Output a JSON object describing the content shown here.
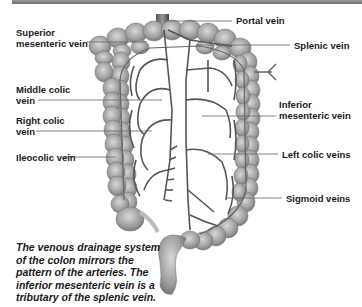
{
  "diagram": {
    "labels": {
      "portal_vein": "Portal vein",
      "superior_mesenteric_vein_l1": "Superior",
      "superior_mesenteric_vein_l2": "mesenteric vein",
      "splenic_vein": "Splenic vein",
      "middle_colic_vein_l1": "Middle colic",
      "middle_colic_vein_l2": "vein",
      "inferior_mesenteric_vein_l1": "Inferior",
      "inferior_mesenteric_vein_l2": "mesenteric vein",
      "right_colic_vein_l1": "Right colic",
      "right_colic_vein_l2": "vein",
      "left_colic_veins": "Left colic veins",
      "ileocolic_vein": "Ileocolic vein",
      "sigmoid_veins": "Sigmoid veins"
    },
    "caption_lines": [
      "The venous drainage system",
      "of the colon mirrors the",
      "pattern of the arteries. The",
      "inferior mesenteric vein is a",
      "tributary of the splenic vein."
    ],
    "colors": {
      "top_bar": "#7a7a7a",
      "colon": "#a8a8a8",
      "vein": "#555555",
      "leader_line": "#666666",
      "text": "#1a1a1a"
    }
  }
}
